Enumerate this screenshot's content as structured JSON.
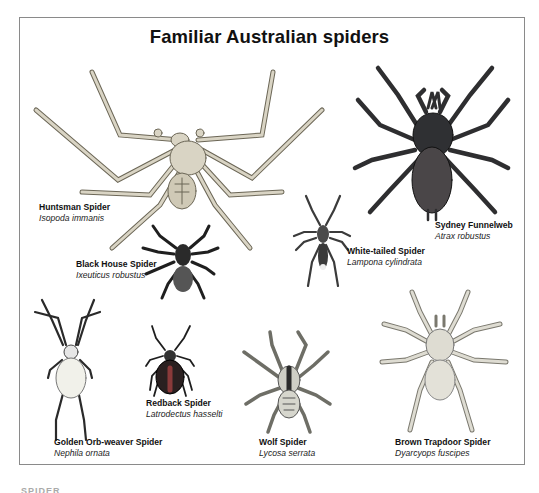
{
  "title": "Familiar Australian spiders",
  "footer_text": "SPIDER",
  "colors": {
    "frame": "#8a8a8a",
    "huntsman": "#d9d4c4",
    "funnelweb": "#3a3a3c",
    "black_house": "#2b2b2b",
    "white_tailed": "#555555",
    "golden_orb": "#efefe6",
    "redback": "#3a2a2a",
    "wolf": "#cfcfc6",
    "trapdoor": "#dedcd2"
  },
  "spiders": [
    {
      "common": "Huntsman Spider",
      "scientific": "Isopoda immanis"
    },
    {
      "common": "Sydney Funnelweb",
      "scientific": "Atrax robustus"
    },
    {
      "common": "Black House Spider",
      "scientific": "Ixeuticus robustus"
    },
    {
      "common": "White-tailed Spider",
      "scientific": "Lampona cylindrata"
    },
    {
      "common": "Golden Orb-weaver Spider",
      "scientific": "Nephila ornata"
    },
    {
      "common": "Redback Spider",
      "scientific": "Latrodectus hasselti"
    },
    {
      "common": "Wolf Spider",
      "scientific": "Lycosa serrata"
    },
    {
      "common": "Brown Trapdoor Spider",
      "scientific": "Dyarcyops fuscipes"
    }
  ]
}
